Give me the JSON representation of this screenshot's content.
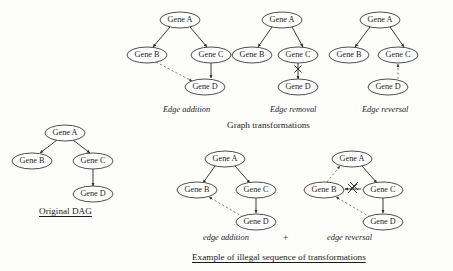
{
  "figure": {
    "title_main": "Graph transformations",
    "title_bottom": "Example of illegal sequence of transformations",
    "original_label": "Original DAG"
  },
  "nodes": {
    "a": "Gene A",
    "b": "Gene B",
    "c": "Gene C",
    "d": "Gene D"
  },
  "panels": {
    "original": {
      "caption": "Original DAG",
      "edges": "A->B, A->C, C->D"
    },
    "edge_addition": {
      "caption": "Edge addition",
      "edges": "A->B, A->C, C->D, B-->D (dashed, added)"
    },
    "edge_removal": {
      "caption": "Edge removal",
      "edges": "A->B, A->C, C->D (marked X, removed)"
    },
    "edge_reversal": {
      "caption": "Edge reversal",
      "edges": "A->B, A->C, D-->C (dashed, reversed)"
    },
    "illegal_addition": {
      "caption": "edge addition",
      "edges": "A->B, A->C, C->D, D-->B (dashed, added)"
    },
    "illegal_reversal": {
      "caption": "edge reversal",
      "edges": "B-->A (dashed, reversed), A->C, C->D, D-->B (dashed), B-C marked X"
    },
    "operator": "+"
  },
  "colors": {
    "background": "#fdfdfc",
    "node_stroke": "#3a3a3a",
    "edge_solid": "#2e2e2e",
    "edge_dashed": "#6a6a6a",
    "text": "#1c1c1c"
  }
}
